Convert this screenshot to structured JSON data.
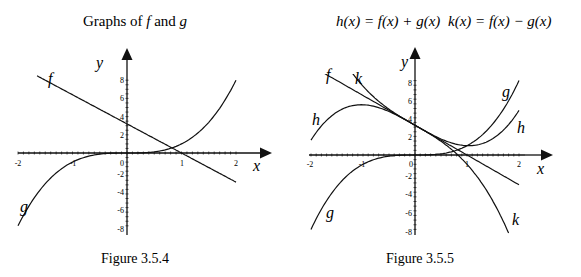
{
  "chart_data": [
    {
      "type": "line",
      "title": "Graphs of f and g",
      "title_parts": {
        "pre": "Graphs of ",
        "f": "f",
        "mid": " and ",
        "g": "g"
      },
      "caption": "Figure 3.5.4",
      "xlabel": "x",
      "ylabel": "y",
      "xlim": [
        -2,
        2
      ],
      "ylim": [
        -8,
        8
      ],
      "x_ticks": [
        "-2",
        "-1",
        "0",
        "1",
        "2"
      ],
      "y_ticks": [
        "8",
        "6",
        "4",
        "2",
        "-2",
        "-4",
        "-6",
        "-8"
      ],
      "series": [
        {
          "name": "f",
          "formula": "3.2 - 3.2x",
          "x_range": [
            -1.65,
            2
          ],
          "points": [
            [
              -1.65,
              8.48
            ],
            [
              -1,
              6.4
            ],
            [
              0,
              3.2
            ],
            [
              1,
              0
            ],
            [
              2,
              -3.2
            ]
          ]
        },
        {
          "name": "g",
          "formula": "x^3",
          "x_range": [
            -2,
            2
          ],
          "points": [
            [
              -2,
              -8
            ],
            [
              -1,
              -1
            ],
            [
              0,
              0
            ],
            [
              1,
              1
            ],
            [
              2,
              8
            ]
          ]
        }
      ]
    },
    {
      "type": "line",
      "title": "h(x) = f(x) + g(x)     k(x) = f(x) − g(x)",
      "title_h": "h(x) = f(x) + g(x)",
      "title_k": "k(x) = f(x) − g(x)",
      "caption": "Figure 3.5.5",
      "xlabel": "x",
      "ylabel": "y",
      "xlim": [
        -2,
        2
      ],
      "ylim": [
        -8,
        8
      ],
      "x_ticks": [
        "-2",
        "-1",
        "0",
        "1",
        "2"
      ],
      "y_ticks": [
        "8",
        "6",
        "4",
        "2",
        "-2",
        "-4",
        "-6",
        "-8"
      ],
      "series": [
        {
          "name": "f",
          "formula": "3.2 - 3.2x",
          "x_range": [
            -1.85,
            2
          ]
        },
        {
          "name": "g",
          "formula": "x^3",
          "x_range": [
            -2,
            2
          ]
        },
        {
          "name": "h",
          "formula": "f(x) + g(x)",
          "x_range": [
            -2,
            2
          ],
          "points": [
            [
              -2,
              1.6
            ],
            [
              -1,
              5.4
            ],
            [
              0,
              3.2
            ],
            [
              1,
              1
            ],
            [
              2,
              4.8
            ]
          ]
        },
        {
          "name": "k",
          "formula": "f(x) - g(x)",
          "x_range": [
            -1.38,
            1.8
          ],
          "points": [
            [
              -1,
              7.4
            ],
            [
              0,
              3.2
            ],
            [
              1,
              -1
            ],
            [
              1.8,
              -8.4
            ]
          ]
        }
      ]
    }
  ],
  "labels": {
    "f": "f",
    "g": "g",
    "h": "h",
    "k": "k",
    "x": "x",
    "y": "y",
    "zero": "0"
  }
}
